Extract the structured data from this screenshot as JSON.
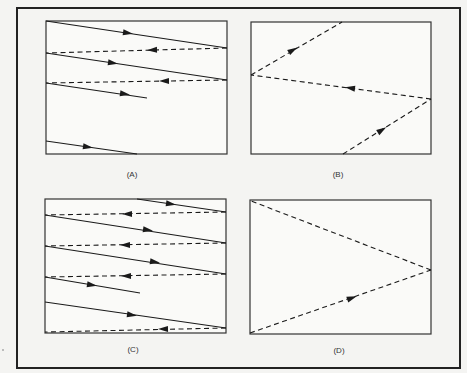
{
  "figure": {
    "panels": [
      {
        "id": "A",
        "label": "(A)",
        "box": {
          "x": 46,
          "y": 21,
          "w": 181,
          "h": 133
        },
        "label_pos": {
          "x": 132,
          "y": 177
        },
        "segments": [
          {
            "style": "solid",
            "x1": 46,
            "y1": 21,
            "x2": 227,
            "y2": 48,
            "arrow": {
              "x": 128,
              "y": 33,
              "dir": "right"
            }
          },
          {
            "style": "dashed",
            "x1": 227,
            "y1": 48,
            "x2": 46,
            "y2": 53,
            "arrow": {
              "x": 152,
              "y": 50,
              "dir": "left"
            }
          },
          {
            "style": "solid",
            "x1": 46,
            "y1": 53,
            "x2": 227,
            "y2": 80,
            "arrow": {
              "x": 113,
              "y": 63,
              "dir": "right"
            }
          },
          {
            "style": "dashed",
            "x1": 227,
            "y1": 80,
            "x2": 46,
            "y2": 83,
            "arrow": {
              "x": 164,
              "y": 81,
              "dir": "left"
            }
          },
          {
            "style": "solid",
            "x1": 46,
            "y1": 83,
            "x2": 147,
            "y2": 98,
            "arrow": {
              "x": 125,
              "y": 94,
              "dir": "right"
            }
          },
          {
            "style": "solid",
            "x1": 46,
            "y1": 141,
            "x2": 137,
            "y2": 154,
            "arrow": {
              "x": 88,
              "y": 147,
              "dir": "right"
            }
          }
        ]
      },
      {
        "id": "B",
        "label": "(B)",
        "box": {
          "x": 251,
          "y": 22,
          "w": 180,
          "h": 132
        },
        "label_pos": {
          "x": 338,
          "y": 177
        },
        "segments": [
          {
            "style": "dashed",
            "x1": 343,
            "y1": 154,
            "x2": 431,
            "y2": 99,
            "arrow": {
              "x": 382,
              "y": 130,
              "dir": "up-right"
            }
          },
          {
            "style": "dashed",
            "x1": 431,
            "y1": 99,
            "x2": 251,
            "y2": 75,
            "arrow": {
              "x": 350,
              "y": 88,
              "dir": "left"
            }
          },
          {
            "style": "dashed",
            "x1": 251,
            "y1": 75,
            "x2": 342,
            "y2": 22,
            "arrow": {
              "x": 293,
              "y": 50,
              "dir": "up-right"
            }
          }
        ]
      },
      {
        "id": "C",
        "label": "(C)",
        "box": {
          "x": 45,
          "y": 199,
          "w": 181,
          "h": 134
        },
        "label_pos": {
          "x": 133,
          "y": 352
        },
        "segments": [
          {
            "style": "solid",
            "x1": 137,
            "y1": 199,
            "x2": 226,
            "y2": 212,
            "arrow": {
              "x": 171,
              "y": 204,
              "dir": "right"
            }
          },
          {
            "style": "dashed",
            "x1": 226,
            "y1": 212,
            "x2": 45,
            "y2": 215,
            "arrow": {
              "x": 127,
              "y": 214,
              "dir": "left"
            }
          },
          {
            "style": "solid",
            "x1": 45,
            "y1": 215,
            "x2": 226,
            "y2": 243,
            "arrow": {
              "x": 148,
              "y": 230,
              "dir": "right"
            }
          },
          {
            "style": "dashed",
            "x1": 226,
            "y1": 243,
            "x2": 45,
            "y2": 246,
            "arrow": {
              "x": 125,
              "y": 245,
              "dir": "left"
            }
          },
          {
            "style": "solid",
            "x1": 45,
            "y1": 246,
            "x2": 226,
            "y2": 274,
            "arrow": {
              "x": 155,
              "y": 262,
              "dir": "right"
            }
          },
          {
            "style": "dashed",
            "x1": 226,
            "y1": 274,
            "x2": 45,
            "y2": 277,
            "arrow": {
              "x": 126,
              "y": 276,
              "dir": "left"
            }
          },
          {
            "style": "solid",
            "x1": 45,
            "y1": 277,
            "x2": 140,
            "y2": 293,
            "arrow": {
              "x": 92,
              "y": 285,
              "dir": "right"
            }
          },
          {
            "style": "solid",
            "x1": 45,
            "y1": 302,
            "x2": 226,
            "y2": 328,
            "arrow": {
              "x": 132,
              "y": 315,
              "dir": "right"
            }
          },
          {
            "style": "dashed",
            "x1": 226,
            "y1": 328,
            "x2": 45,
            "y2": 332,
            "arrow": {
              "x": 163,
              "y": 329,
              "dir": "left"
            }
          }
        ]
      },
      {
        "id": "D",
        "label": "(D)",
        "box": {
          "x": 250,
          "y": 200,
          "w": 181,
          "h": 134
        },
        "label_pos": {
          "x": 339,
          "y": 353
        },
        "segments": [
          {
            "style": "dashed",
            "x1": 250,
            "y1": 333,
            "x2": 431,
            "y2": 270,
            "arrow": {
              "x": 352,
              "y": 298,
              "dir": "up-right-shallow"
            }
          },
          {
            "style": "dashed",
            "x1": 431,
            "y1": 270,
            "x2": 251,
            "y2": 201,
            "arrow": null
          }
        ]
      }
    ],
    "outer_frame": {
      "x": 17,
      "y": 8,
      "w": 443,
      "h": 360
    },
    "colors": {
      "ink": "#1a1a1a",
      "paper": "#f4f4f2",
      "frame": "#222222"
    }
  }
}
